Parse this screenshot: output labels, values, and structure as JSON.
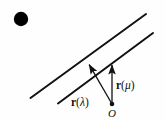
{
  "figure": {
    "background_color": "#fefefe",
    "ink_color": "#111111",
    "bullet": {
      "name": "bullet-marker",
      "cx": 21,
      "cy": 19,
      "r": 7.2,
      "color": "#000000"
    },
    "lines": [
      {
        "name": "upper-parallel-line",
        "x1": 30.5,
        "y1": 98.0,
        "x2": 146.0,
        "y2": 14.0,
        "width": 2.0
      },
      {
        "name": "lower-parallel-line",
        "x1": 58.0,
        "y1": 103.5,
        "x2": 153.0,
        "y2": 33.0,
        "width": 2.0
      }
    ],
    "origin_point": {
      "name": "origin-point-O",
      "cx": 112.0,
      "cy": 104.0,
      "r": 2.3
    },
    "vectors": [
      {
        "name": "vector-r-lambda",
        "x1": 112.0,
        "y1": 104.0,
        "x2": 88.0,
        "y2": 62.5,
        "width": 1.3,
        "arrowhead": "filled-triangle"
      },
      {
        "name": "vector-r-mu",
        "x1": 112.0,
        "y1": 104.0,
        "x2": 112.0,
        "y2": 62.5,
        "width": 1.3,
        "arrowhead": "filled-triangle"
      }
    ],
    "labels": {
      "r_lambda": {
        "name": "label-r-lambda",
        "r": "r",
        "open_paren": "(",
        "greek": "λ",
        "close_paren": ")",
        "x": 71,
        "y": 97
      },
      "r_mu": {
        "name": "label-r-mu",
        "r": "r",
        "open_paren": "(",
        "greek": "μ",
        "close_paren": ")",
        "x": 116,
        "y": 80
      },
      "origin": {
        "name": "label-origin-O",
        "text": "O",
        "x": 108,
        "y": 108
      }
    }
  }
}
